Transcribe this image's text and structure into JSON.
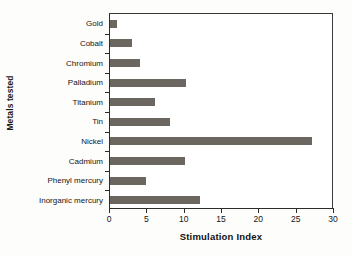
{
  "chart_data": {
    "type": "bar",
    "orientation": "horizontal",
    "title": "",
    "xlabel": "Stimulation Index",
    "ylabel": "Metals tested",
    "categories": [
      "Gold",
      "Cobalt",
      "Chromium",
      "Palladium",
      "Titanium",
      "Tin",
      "Nickel",
      "Cadmium",
      "Phenyl mercury",
      "Inorganic mercury"
    ],
    "values": [
      1,
      3,
      4,
      10.2,
      6,
      8,
      27,
      10,
      4.8,
      12
    ],
    "xlim": [
      0,
      30
    ],
    "xticks": [
      0,
      5,
      10,
      15,
      20,
      25,
      30
    ],
    "xtick_labels": [
      "0",
      "5",
      "10",
      "15",
      "20",
      "25",
      "30"
    ],
    "grid": false,
    "legend": false,
    "bar_color": "#6b6760",
    "axis_color": "#2b2b29",
    "background": "#ffffff"
  }
}
